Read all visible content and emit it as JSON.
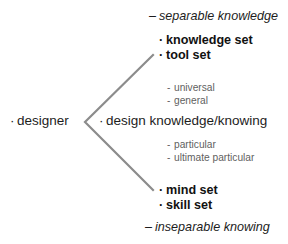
{
  "diagram": {
    "type": "branching-concept-diagram",
    "background_color": "#ffffff",
    "line_color": "#8c8c8c",
    "text_color": "#1d1d1d",
    "muted_text_color": "#5f5f5f",
    "bullet_glyph": "·",
    "dash_glyph": "-",
    "en_dash_glyph": "–",
    "root": {
      "bullet": "·",
      "label": "designer"
    },
    "center": {
      "bullet": "·",
      "label": "design knowledge/knowing"
    },
    "branches": [
      {
        "position": "upper",
        "caption": "separable knowledge",
        "caption_dash": "–",
        "items": [
          {
            "bullet": "·",
            "label": "knowledge set"
          },
          {
            "bullet": "·",
            "label": "tool set"
          }
        ],
        "sub_items": [
          {
            "dash": "-",
            "label": "universal"
          },
          {
            "dash": "-",
            "label": "general"
          }
        ]
      },
      {
        "position": "lower",
        "caption": "inseparable knowing",
        "caption_dash": "–",
        "items": [
          {
            "bullet": "·",
            "label": "mind set"
          },
          {
            "bullet": "·",
            "label": "skill set"
          }
        ],
        "sub_items": [
          {
            "dash": "-",
            "label": "particular"
          },
          {
            "dash": "-",
            "label": "ultimate particular"
          }
        ]
      }
    ]
  }
}
